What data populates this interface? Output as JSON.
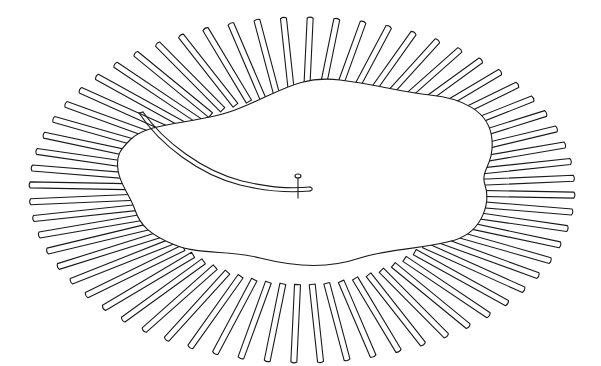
{
  "figure": {
    "colors": {
      "ink": "#1a1a1a",
      "background": "#ffffff"
    },
    "ellipse": {
      "cx": 302,
      "cy": 190,
      "rx_outer": 272,
      "ry_outer": 172
    },
    "strip_count": 64,
    "strip_width": 6
  }
}
